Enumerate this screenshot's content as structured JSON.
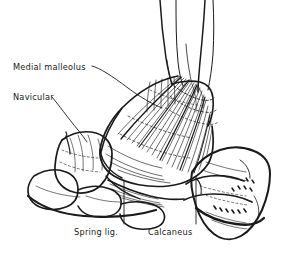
{
  "figure": {
    "background_color": "#ffffff",
    "ink_color": "#1a1a1a",
    "width": 288,
    "height": 257
  },
  "labels": {
    "medial_malleolus": "Medial malleolus",
    "navicular": "Navicular",
    "spring_lig": "Spring lig.",
    "calcaneus": "Calcaneus"
  },
  "structures": [
    {
      "name": "tibia-shaft",
      "label": null
    },
    {
      "name": "fibula-shaft",
      "label": null
    },
    {
      "name": "medial-malleolus",
      "label": "Medial malleolus"
    },
    {
      "name": "deltoid-ligament-fan",
      "label": null
    },
    {
      "name": "navicular-bone",
      "label": "Navicular"
    },
    {
      "name": "spring-ligament",
      "label": "Spring lig."
    },
    {
      "name": "calcaneus-bone",
      "label": "Calcaneus"
    },
    {
      "name": "tarsal-bones",
      "label": null
    }
  ]
}
